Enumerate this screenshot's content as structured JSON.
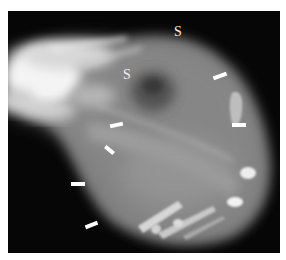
{
  "figure": {
    "type": "radiograph",
    "labels": [
      {
        "id": "s-upper",
        "text": "S",
        "x": 174,
        "y": 24
      },
      {
        "id": "s-middle",
        "text": "S",
        "x": 123,
        "y": 67
      }
    ],
    "arrows": [
      {
        "id": "arrow-1",
        "x": 213,
        "y": 74,
        "length": 14,
        "angle": -20
      },
      {
        "id": "arrow-2",
        "x": 232,
        "y": 123,
        "length": 14,
        "angle": 0
      },
      {
        "id": "arrow-3",
        "x": 110,
        "y": 123,
        "length": 13,
        "angle": -12
      },
      {
        "id": "arrow-4",
        "x": 104,
        "y": 148,
        "length": 11,
        "angle": 40
      },
      {
        "id": "arrow-5",
        "x": 71,
        "y": 182,
        "length": 14,
        "angle": 0
      },
      {
        "id": "arrow-6",
        "x": 85,
        "y": 223,
        "length": 13,
        "angle": -22
      }
    ],
    "colors": {
      "background": "#050505",
      "annotation": "#ffffff",
      "border": "#ffffff"
    }
  }
}
